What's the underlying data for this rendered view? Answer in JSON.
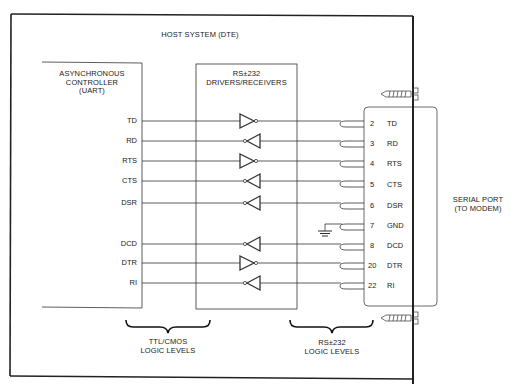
{
  "figure": {
    "host_title": "HOST SYSTEM (DTE)",
    "uart_block": {
      "line1": "ASYNCHRONOUS",
      "line2": "CONTROLLER",
      "line3": "(UART)"
    },
    "driver_block": {
      "line1": "RS±232",
      "line2": "DRIVERS/RECEIVERS"
    },
    "serial_port": {
      "line1": "SERIAL PORT",
      "line2": "(TO MODEM)"
    },
    "brace_labels": {
      "ttl_line1": "TTL/CMOS",
      "ttl_line2": "LOGIC LEVELS",
      "rs_line1": "RS±232",
      "rs_line2": "LOGIC LEVELS"
    },
    "signals": [
      {
        "uart": "TD",
        "pin": "2",
        "name": "TD",
        "direction": "driver"
      },
      {
        "uart": "RD",
        "pin": "3",
        "name": "RD",
        "direction": "receiver"
      },
      {
        "uart": "RTS",
        "pin": "4",
        "name": "RTS",
        "direction": "driver"
      },
      {
        "uart": "CTS",
        "pin": "5",
        "name": "CTS",
        "direction": "receiver"
      },
      {
        "uart": "DSR",
        "pin": "6",
        "name": "DSR",
        "direction": "receiver"
      },
      {
        "uart": "",
        "pin": "7",
        "name": "GND",
        "direction": "ground"
      },
      {
        "uart": "DCD",
        "pin": "8",
        "name": "DCD",
        "direction": "receiver"
      },
      {
        "uart": "DTR",
        "pin": "20",
        "name": "DTR",
        "direction": "driver"
      },
      {
        "uart": "RI",
        "pin": "22",
        "name": "RI",
        "direction": "receiver"
      }
    ]
  }
}
